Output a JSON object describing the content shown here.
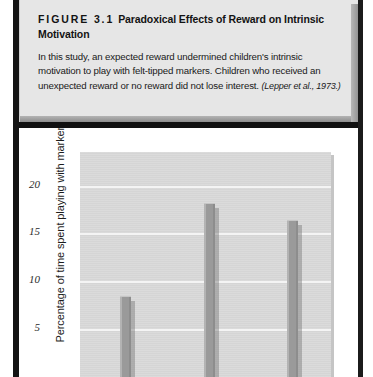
{
  "figure": {
    "number_label": "FIGURE 3.1",
    "title": "Paradoxical Effects of Reward on Intrinsic Motivation",
    "body": "In this study, an expected reward undermined children's intrinsic motivation to play with felt-tipped markers. Children who received an unexpected reward or no reward did not lose interest.",
    "citation": "(Lepper et al., 1973.)"
  },
  "chart_data": {
    "type": "bar",
    "title": "",
    "xlabel": "",
    "ylabel": "Percentage of time spent playing with markers",
    "categories": [
      "Expected reward",
      "Unexpected reward",
      "No reward"
    ],
    "values": [
      8.5,
      18.2,
      16.4
    ],
    "ylim": [
      0,
      23.5
    ],
    "yticks": [
      5,
      10,
      15,
      20
    ],
    "ytick_labels": [
      "5",
      "10",
      "15",
      "20"
    ],
    "grid": true,
    "legend": "none",
    "note": "x-axis category labels are cropped off the bottom of the screenshot",
    "colors": {
      "bar_fill": "#9a9a9a",
      "plot_background": "#d9d9d9",
      "gridline": "#f4f4f4",
      "page_background": "#ffffff",
      "caption_background": "#e6e6e6"
    }
  }
}
